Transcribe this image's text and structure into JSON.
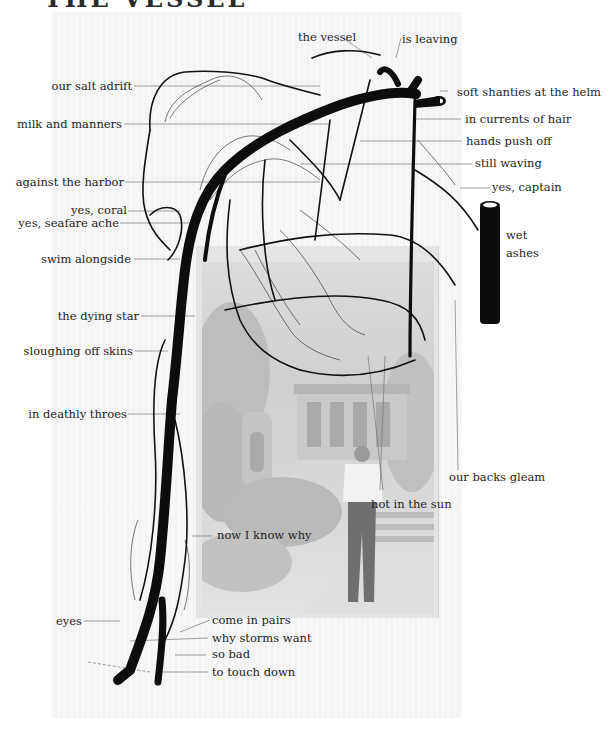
{
  "title": "THE VESSEL",
  "artwork": {
    "description": "Black vascular illustration overlaid on a faded vintage photograph of a man standing before a house",
    "colors": {
      "ink": "#111111",
      "leader_line": "#777777",
      "paper": "#f5f5f5",
      "photo_tone": "#d0d0d0"
    }
  },
  "labels_left": [
    {
      "id": "our-salt-adrift",
      "text": "our salt adrift"
    },
    {
      "id": "milk-and-manners",
      "text": "milk and manners"
    },
    {
      "id": "against-the-harbor",
      "text": "against the harbor"
    },
    {
      "id": "yes-coral",
      "text": "yes, coral"
    },
    {
      "id": "yes-seafare-ache",
      "text": "yes, seafare ache"
    },
    {
      "id": "swim-alongside",
      "text": "swim alongside"
    },
    {
      "id": "the-dying-star",
      "text": "the dying star"
    },
    {
      "id": "sloughing-off-skins",
      "text": "sloughing off skins"
    },
    {
      "id": "in-deathly-throes",
      "text": "in deathly throes"
    },
    {
      "id": "eyes",
      "text": "eyes"
    }
  ],
  "labels_top": [
    {
      "id": "the-vessel",
      "text": "the vessel"
    },
    {
      "id": "is-leaving",
      "text": "is leaving"
    }
  ],
  "labels_right": [
    {
      "id": "soft-shanties",
      "text": "soft shanties at the helm"
    },
    {
      "id": "in-currents-of-hair",
      "text": "in currents of hair"
    },
    {
      "id": "hands-push-off",
      "text": "hands push off"
    },
    {
      "id": "still-waving",
      "text": "still waving"
    },
    {
      "id": "yes-captain",
      "text": "yes, captain"
    },
    {
      "id": "wet",
      "text": "wet"
    },
    {
      "id": "ashes",
      "text": "ashes"
    },
    {
      "id": "our-backs-gleam",
      "text": "our backs gleam"
    }
  ],
  "labels_center": [
    {
      "id": "hot-in-the-sun",
      "text": "hot in the sun"
    },
    {
      "id": "now-i-know-why",
      "text": "now I know why"
    },
    {
      "id": "come-in-pairs",
      "text": "come in pairs"
    },
    {
      "id": "why-storms-want",
      "text": "why storms want"
    },
    {
      "id": "so-bad",
      "text": "so bad"
    },
    {
      "id": "to-touch-down",
      "text": "to touch down"
    }
  ]
}
